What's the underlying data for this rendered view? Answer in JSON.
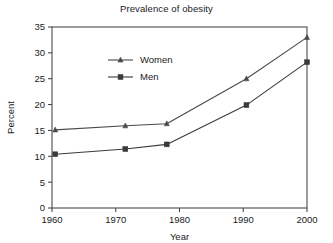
{
  "chart_data": {
    "type": "line",
    "title": "Prevalence of obesity",
    "xlabel": "Year",
    "ylabel": "Percent",
    "xlim": [
      1960,
      2000
    ],
    "ylim": [
      0,
      35
    ],
    "xticks": [
      1960,
      1970,
      1980,
      1990,
      2000
    ],
    "xtick_labels": [
      "1960",
      "1970",
      "1980",
      "1990",
      "2000"
    ],
    "yticks": [
      0,
      5,
      10,
      15,
      20,
      25,
      30,
      35
    ],
    "ytick_labels": [
      "0",
      "5",
      "10",
      "15",
      "20",
      "25",
      "30",
      "35"
    ],
    "grid": false,
    "legend_position": "upper-left-inside",
    "x": [
      1960.5,
      1971.5,
      1978,
      1990.5,
      2000
    ],
    "series": [
      {
        "name": "Women",
        "marker": "triangle",
        "color": "#4a4a4a",
        "values": [
          15.1,
          15.9,
          16.3,
          25.0,
          33.0
        ]
      },
      {
        "name": "Men",
        "marker": "square",
        "color": "#3a3a3a",
        "values": [
          10.4,
          11.4,
          12.3,
          19.9,
          28.2
        ]
      }
    ]
  },
  "legend": {
    "entries": [
      {
        "label": "Women"
      },
      {
        "label": "Men"
      }
    ]
  },
  "colors": {
    "axis": "#3a3a3a",
    "text": "#1a1a1a",
    "women_line": "#4a4a4a",
    "men_line": "#3a3a3a",
    "background": "#ffffff"
  }
}
